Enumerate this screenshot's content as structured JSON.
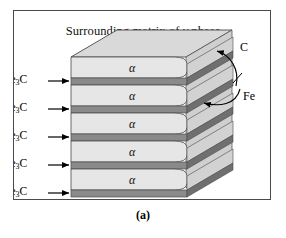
{
  "figure": {
    "caption": "(a)",
    "title_prefix": "Surrounding matrix of ",
    "title_symbol": "γ",
    "title_suffix": " phase",
    "panel_border_color": "#4a4a4a",
    "background_color": "#ffffff"
  },
  "colors": {
    "ferrite_face": "#e3e3e3",
    "ferrite_top": "#d6d6d6",
    "ferrite_side": "#c9c9c9",
    "cementite_face": "#8a8a8a",
    "cementite_top": "#a3a3a3",
    "cementite_side": "#6f6f6f",
    "outline": "#4a4a4a",
    "arrow": "#000000"
  },
  "diagram": {
    "type": "lamellar-pearlite-schematic",
    "ferrite_symbol": "α",
    "cementite_formula_base": "Fe",
    "cementite_formula_sub": "3",
    "cementite_formula_tail": "C",
    "ferrite_layer_count": 5,
    "cementite_layer_count": 5,
    "ferrite_labels": [
      {
        "symbol": "α",
        "x": 118,
        "y": 57
      },
      {
        "symbol": "α",
        "x": 118,
        "y": 85
      },
      {
        "symbol": "α",
        "x": 118,
        "y": 113
      },
      {
        "symbol": "α",
        "x": 118,
        "y": 141
      },
      {
        "symbol": "α",
        "x": 118,
        "y": 169
      }
    ],
    "left_labels": [
      {
        "text": "Fe3C",
        "y": 72
      },
      {
        "text": "Fe3C",
        "y": 100
      },
      {
        "text": "Fe3C",
        "y": 128
      },
      {
        "text": "Fe3C",
        "y": 156
      },
      {
        "text": "Fe3C",
        "y": 184
      }
    ],
    "annotations": [
      {
        "name": "carbon",
        "label": "C",
        "x": 240,
        "y": 47
      },
      {
        "name": "iron",
        "label": "Fe",
        "x": 243,
        "y": 96
      }
    ]
  }
}
